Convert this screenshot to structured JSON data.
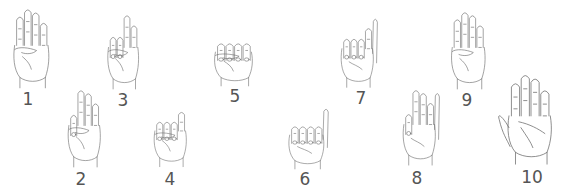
{
  "colors": {
    "line": "#666666",
    "background": "#ffffff",
    "label": "#555555"
  },
  "hands": [
    {
      "number": "1",
      "x": 5,
      "y": 5,
      "w": 50,
      "h": 88,
      "lx": 13,
      "ly": 91,
      "fingers": [
        1,
        1,
        1,
        1
      ],
      "thumb": "folded"
    },
    {
      "number": "2",
      "x": 60,
      "y": 86,
      "w": 46,
      "h": 86,
      "lx": 66,
      "ly": 171,
      "fingers": [
        0,
        1,
        1,
        1
      ],
      "thumb": "folded"
    },
    {
      "number": "3",
      "x": 100,
      "y": 8,
      "w": 44,
      "h": 86,
      "lx": 108,
      "ly": 92,
      "fingers": [
        0,
        0,
        1,
        1
      ],
      "thumb": "folded"
    },
    {
      "number": "4",
      "x": 146,
      "y": 97,
      "w": 46,
      "h": 74,
      "lx": 155,
      "ly": 171,
      "fingers": [
        0,
        0,
        0,
        1
      ],
      "thumb": "folded"
    },
    {
      "number": "5",
      "x": 205,
      "y": 20,
      "w": 54,
      "h": 70,
      "lx": 220,
      "ly": 88,
      "fingers": [
        0,
        0,
        0,
        0
      ],
      "thumb": "folded"
    },
    {
      "number": "6",
      "x": 280,
      "y": 103,
      "w": 50,
      "h": 70,
      "lx": 290,
      "ly": 171,
      "fingers": [
        0,
        0,
        0,
        0
      ],
      "thumb": "up"
    },
    {
      "number": "7",
      "x": 333,
      "y": 12,
      "w": 46,
      "h": 80,
      "lx": 346,
      "ly": 90,
      "fingers": [
        0,
        0,
        0,
        1
      ],
      "thumb": "up"
    },
    {
      "number": "8",
      "x": 395,
      "y": 86,
      "w": 46,
      "h": 84,
      "lx": 402,
      "ly": 170,
      "fingers": [
        0,
        1,
        1,
        1
      ],
      "thumb": "up"
    },
    {
      "number": "9",
      "x": 443,
      "y": 8,
      "w": 48,
      "h": 86,
      "lx": 452,
      "ly": 92,
      "fingers": [
        1,
        1,
        1,
        1
      ],
      "thumb": "folded"
    },
    {
      "number": "10",
      "x": 497,
      "y": 70,
      "w": 62,
      "h": 100,
      "lx": 517,
      "ly": 169,
      "fingers": [
        1,
        1,
        1,
        1
      ],
      "thumb": "out"
    }
  ]
}
